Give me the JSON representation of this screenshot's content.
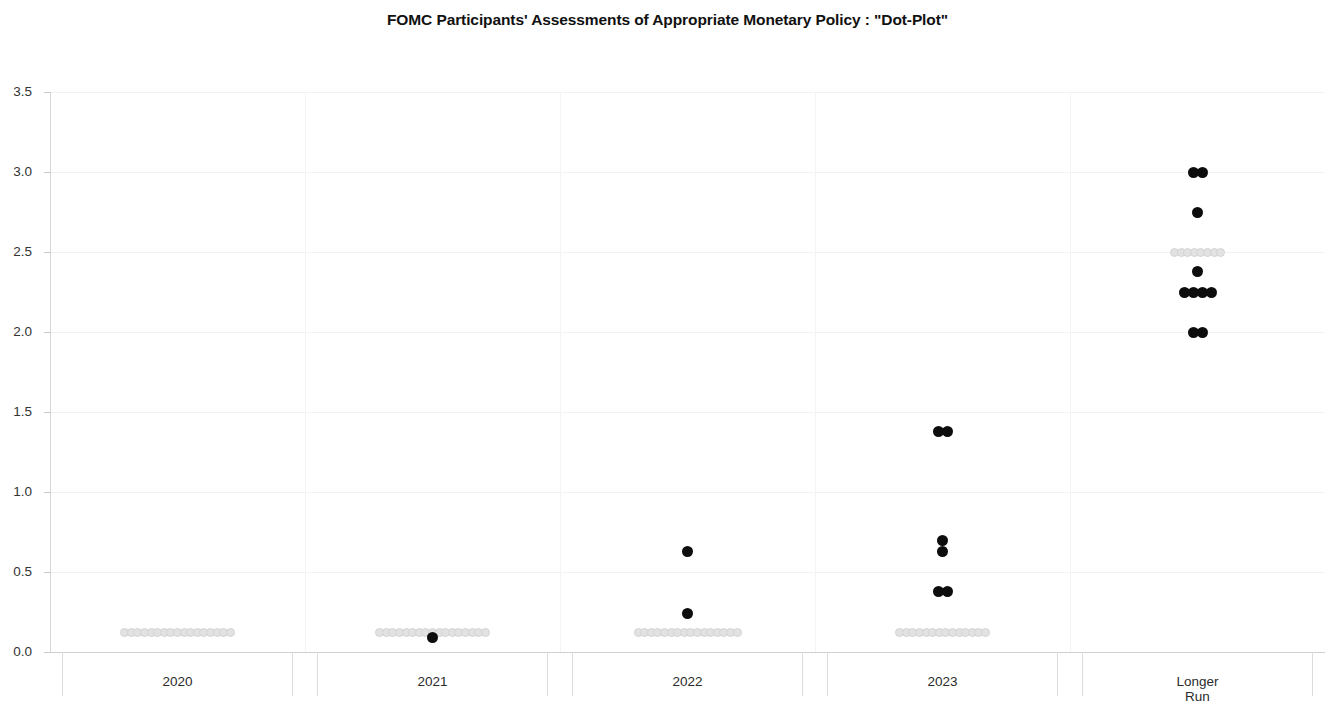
{
  "chart_data": {
    "type": "scatter",
    "title": "FOMC Participants' Assessments of Appropriate Monetary Policy : \"Dot-Plot\"",
    "xlabel": "",
    "ylabel": "",
    "ylim": [
      0.0,
      3.5
    ],
    "yticks": [
      "0.0",
      "0.5",
      "1.0",
      "1.5",
      "2.0",
      "2.5",
      "3.0",
      "3.5"
    ],
    "ytick_values": [
      0.0,
      0.5,
      1.0,
      1.5,
      2.0,
      2.5,
      3.0,
      3.5
    ],
    "grid": true,
    "legend": "none",
    "categories": [
      "2020",
      "2021",
      "2022",
      "2023",
      "Longer\nRun"
    ],
    "colors": {
      "dark_dot": "#0d0d0d",
      "light_dot": "#e2e2e2",
      "gridline": "#f2f2f2",
      "axis": "#cfcfcf",
      "text": "#222222"
    },
    "series": [
      {
        "name": "2020",
        "category_index": 0,
        "points": [
          {
            "value": 0.125,
            "count": 17,
            "shade": "light"
          }
        ]
      },
      {
        "name": "2021",
        "category_index": 1,
        "points": [
          {
            "value": 0.125,
            "count": 17,
            "shade": "light"
          },
          {
            "value": 0.09,
            "count": 1,
            "shade": "dark"
          }
        ]
      },
      {
        "name": "2022",
        "category_index": 2,
        "points": [
          {
            "value": 0.125,
            "count": 16,
            "shade": "light"
          },
          {
            "value": 0.24,
            "count": 1,
            "shade": "dark"
          },
          {
            "value": 0.63,
            "count": 1,
            "shade": "dark"
          }
        ]
      },
      {
        "name": "2023",
        "category_index": 3,
        "points": [
          {
            "value": 0.125,
            "count": 14,
            "shade": "light"
          },
          {
            "value": 0.38,
            "count": 2,
            "shade": "dark"
          },
          {
            "value": 0.63,
            "count": 1,
            "shade": "dark"
          },
          {
            "value": 0.7,
            "count": 1,
            "shade": "dark"
          },
          {
            "value": 1.38,
            "count": 2,
            "shade": "dark"
          }
        ]
      },
      {
        "name": "Longer Run",
        "category_index": 4,
        "points": [
          {
            "value": 2.0,
            "count": 2,
            "shade": "dark"
          },
          {
            "value": 2.25,
            "count": 4,
            "shade": "dark"
          },
          {
            "value": 2.38,
            "count": 1,
            "shade": "dark"
          },
          {
            "value": 2.5,
            "count": 8,
            "shade": "light"
          },
          {
            "value": 2.75,
            "count": 1,
            "shade": "dark"
          },
          {
            "value": 3.0,
            "count": 2,
            "shade": "dark"
          }
        ]
      }
    ]
  }
}
